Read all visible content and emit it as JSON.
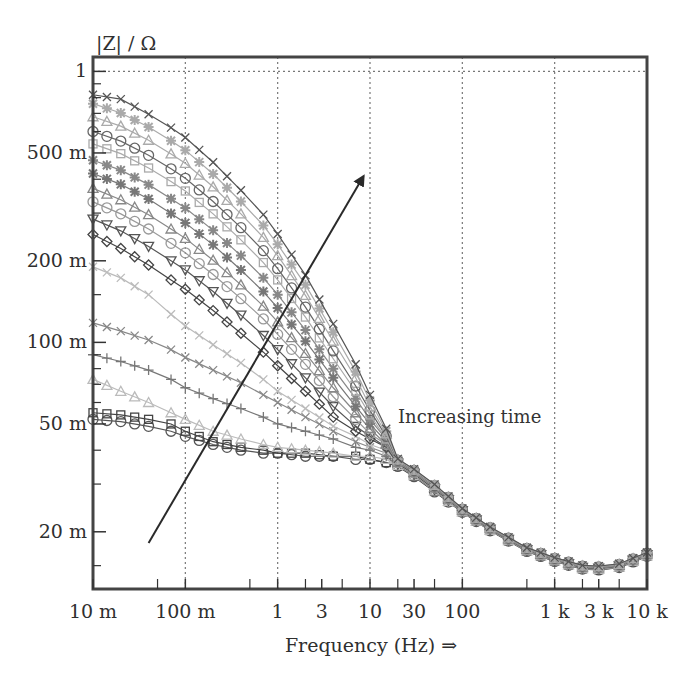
{
  "chart_data": {
    "type": "line",
    "title": "",
    "ylabel": "|Z| / Ω",
    "xlabel": "Frequency (Hz) ⇒",
    "xscale": "log",
    "yscale": "log",
    "xlim": [
      0.01,
      10000
    ],
    "ylim": [
      0.0123,
      1.13
    ],
    "x_ticks": [
      {
        "value": 0.01,
        "label": "10 m"
      },
      {
        "value": 0.1,
        "label": "100 m"
      },
      {
        "value": 1,
        "label": "1"
      },
      {
        "value": 3,
        "label": "3"
      },
      {
        "value": 10,
        "label": "10"
      },
      {
        "value": 30,
        "label": "30"
      },
      {
        "value": 100,
        "label": "100"
      },
      {
        "value": 1000,
        "label": "1 k"
      },
      {
        "value": 3000,
        "label": "3 k"
      },
      {
        "value": 10000,
        "label": "10 k"
      }
    ],
    "x_minor_ticks": [
      0.05,
      0.5,
      2,
      5,
      20,
      50,
      500,
      2000,
      5000
    ],
    "y_ticks": [
      {
        "value": 1,
        "label": "1"
      },
      {
        "value": 0.5,
        "label": "500 m"
      },
      {
        "value": 0.2,
        "label": "200 m"
      },
      {
        "value": 0.1,
        "label": "100 m"
      },
      {
        "value": 0.05,
        "label": "50 m"
      },
      {
        "value": 0.02,
        "label": "20 m"
      }
    ],
    "y_minor_ticks": [
      0.9,
      0.8,
      0.7,
      0.6,
      0.4,
      0.3,
      0.15,
      0.09,
      0.08,
      0.07,
      0.06,
      0.04,
      0.03,
      0.015
    ],
    "grid": {
      "vertical_dotted_at": [
        0.1,
        1,
        10,
        100,
        1000
      ],
      "horizontal_dotted_at": [
        1
      ]
    },
    "legend": null,
    "annotations": [
      {
        "text": "Increasing time",
        "x": 30,
        "y": 0.052
      },
      {
        "type": "arrow",
        "from": {
          "x": 0.04,
          "y": 0.0182
        },
        "to": {
          "x": 8.5,
          "y": 0.41
        },
        "label_ref": "Increasing time"
      }
    ],
    "shared_tail": {
      "x": [
        20,
        30,
        50,
        100,
        200,
        500,
        1000,
        2000,
        3000,
        5000,
        10000
      ],
      "y": [
        0.036,
        0.033,
        0.029,
        0.024,
        0.0205,
        0.0172,
        0.0158,
        0.0148,
        0.0147,
        0.015,
        0.0165
      ]
    },
    "x_points": [
      0.01,
      0.02,
      0.04,
      0.07,
      0.1,
      0.2,
      0.4,
      0.7,
      1,
      2,
      4,
      7,
      10,
      15
    ],
    "series": [
      {
        "name": "t1",
        "marker": "circle",
        "color": "#555555",
        "values": [
          0.052,
          0.051,
          0.049,
          0.047,
          0.045,
          0.042,
          0.04,
          0.039,
          0.039,
          0.038,
          0.038,
          0.037,
          0.037,
          0.036
        ]
      },
      {
        "name": "t2",
        "marker": "square",
        "color": "#444444",
        "values": [
          0.055,
          0.054,
          0.052,
          0.05,
          0.047,
          0.043,
          0.041,
          0.04,
          0.039,
          0.039,
          0.038,
          0.038,
          0.037,
          0.036
        ]
      },
      {
        "name": "t3",
        "marker": "triangle",
        "color": "#bbbbbb",
        "values": [
          0.073,
          0.066,
          0.06,
          0.055,
          0.052,
          0.047,
          0.044,
          0.042,
          0.041,
          0.04,
          0.039,
          0.038,
          0.038,
          0.037
        ]
      },
      {
        "name": "t4",
        "marker": "plus",
        "color": "#777777",
        "values": [
          0.09,
          0.085,
          0.079,
          0.073,
          0.068,
          0.062,
          0.057,
          0.053,
          0.05,
          0.047,
          0.044,
          0.041,
          0.04,
          0.038
        ]
      },
      {
        "name": "t5",
        "marker": "x",
        "color": "#888888",
        "values": [
          0.118,
          0.11,
          0.102,
          0.094,
          0.088,
          0.079,
          0.071,
          0.064,
          0.06,
          0.053,
          0.047,
          0.043,
          0.041,
          0.039
        ]
      },
      {
        "name": "t6",
        "marker": "x",
        "color": "#bbbbbb",
        "values": [
          0.19,
          0.173,
          0.15,
          0.127,
          0.115,
          0.098,
          0.084,
          0.073,
          0.066,
          0.057,
          0.049,
          0.045,
          0.042,
          0.04
        ]
      },
      {
        "name": "t7",
        "marker": "diamond",
        "color": "#444444",
        "values": [
          0.25,
          0.222,
          0.193,
          0.17,
          0.157,
          0.131,
          0.108,
          0.092,
          0.082,
          0.066,
          0.053,
          0.047,
          0.044,
          0.041
        ]
      },
      {
        "name": "t8",
        "marker": "tri-down",
        "color": "#555555",
        "values": [
          0.285,
          0.258,
          0.226,
          0.2,
          0.185,
          0.154,
          0.126,
          0.106,
          0.094,
          0.074,
          0.058,
          0.049,
          0.045,
          0.041
        ]
      },
      {
        "name": "t9",
        "marker": "circle",
        "color": "#999999",
        "values": [
          0.33,
          0.298,
          0.262,
          0.232,
          0.214,
          0.178,
          0.145,
          0.122,
          0.107,
          0.083,
          0.063,
          0.052,
          0.046,
          0.042
        ]
      },
      {
        "name": "t10",
        "marker": "triangle",
        "color": "#888888",
        "values": [
          0.37,
          0.336,
          0.296,
          0.262,
          0.242,
          0.201,
          0.163,
          0.136,
          0.119,
          0.091,
          0.068,
          0.055,
          0.048,
          0.042
        ]
      },
      {
        "name": "t11",
        "marker": "star",
        "color": "#777777",
        "values": [
          0.42,
          0.383,
          0.338,
          0.299,
          0.276,
          0.229,
          0.185,
          0.154,
          0.134,
          0.101,
          0.074,
          0.058,
          0.05,
          0.043
        ]
      },
      {
        "name": "t12",
        "marker": "star",
        "color": "#888888",
        "values": [
          0.47,
          0.432,
          0.382,
          0.339,
          0.313,
          0.259,
          0.209,
          0.173,
          0.15,
          0.111,
          0.08,
          0.062,
          0.052,
          0.044
        ]
      },
      {
        "name": "t13",
        "marker": "square",
        "color": "#aaaaaa",
        "values": [
          0.54,
          0.497,
          0.44,
          0.392,
          0.362,
          0.298,
          0.239,
          0.197,
          0.17,
          0.124,
          0.087,
          0.066,
          0.054,
          0.044
        ]
      },
      {
        "name": "t14",
        "marker": "circle",
        "color": "#666666",
        "values": [
          0.6,
          0.553,
          0.49,
          0.437,
          0.403,
          0.331,
          0.265,
          0.218,
          0.187,
          0.135,
          0.093,
          0.069,
          0.056,
          0.045
        ]
      },
      {
        "name": "t15",
        "marker": "triangle",
        "color": "#aaaaaa",
        "values": [
          0.68,
          0.628,
          0.557,
          0.496,
          0.458,
          0.375,
          0.298,
          0.244,
          0.209,
          0.149,
          0.101,
          0.074,
          0.058,
          0.046
        ]
      },
      {
        "name": "t16",
        "marker": "star",
        "color": "#aaaaaa",
        "values": [
          0.76,
          0.702,
          0.623,
          0.555,
          0.512,
          0.418,
          0.331,
          0.27,
          0.23,
          0.163,
          0.109,
          0.078,
          0.061,
          0.047
        ]
      },
      {
        "name": "t17",
        "marker": "x",
        "color": "#555555",
        "values": [
          0.82,
          0.79,
          0.695,
          0.62,
          0.57,
          0.462,
          0.364,
          0.296,
          0.251,
          0.177,
          0.117,
          0.083,
          0.064,
          0.048
        ]
      }
    ]
  }
}
